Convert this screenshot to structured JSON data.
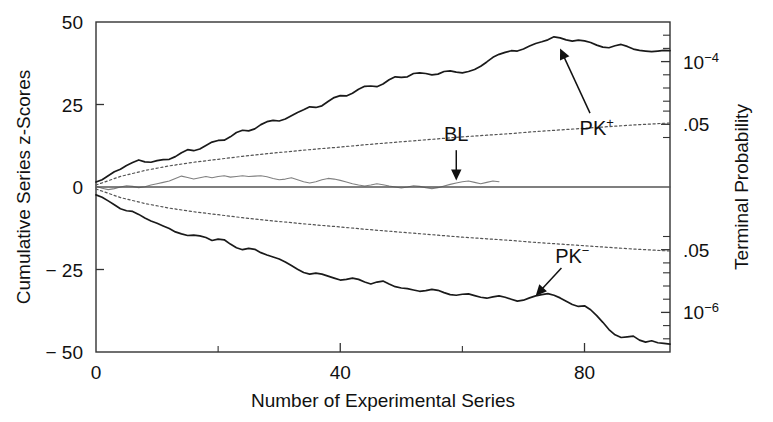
{
  "chart_data": {
    "type": "line",
    "title": "",
    "xlabel": "Number of Experimental Series",
    "ylabel": "Cumulative Series z-Scores",
    "y2label": "Terminal Probability",
    "xlim": [
      0,
      94
    ],
    "ylim": [
      -50,
      50
    ],
    "grid": false,
    "legend_position": "inline-annotations",
    "xticks": [
      0,
      40,
      80
    ],
    "xticklabels": [
      "0",
      "40",
      "80"
    ],
    "xminorticks": [
      20,
      60
    ],
    "yticks": [
      50,
      25,
      0,
      -25,
      -50
    ],
    "yticklabels": [
      "50",
      "25",
      "0",
      "− 25",
      "− 50"
    ],
    "y2ticks": [
      38,
      19,
      -19,
      -38
    ],
    "y2ticklabels": [
      "10⁻⁴",
      ".05",
      ".05",
      "10⁻⁶"
    ],
    "y2minorticks": [
      46,
      42,
      34,
      30,
      26,
      23,
      15,
      -15,
      -23,
      -26,
      -30,
      -34,
      -42,
      -46
    ],
    "annotations": [
      {
        "text": "PK⁺",
        "x": 82,
        "y": 18,
        "arrow_to_x": 76,
        "arrow_to_y": 42
      },
      {
        "text": "PK⁻",
        "x": 78,
        "y": -21,
        "arrow_to_x": 72,
        "arrow_to_y": -33
      },
      {
        "text": "BL",
        "x": 59,
        "y": 16,
        "arrow_to_x": 59,
        "arrow_to_y": 2
      }
    ],
    "series": [
      {
        "name": "PK+",
        "style": "solid",
        "color": "#1a1a1a",
        "width": 1.7,
        "x": [
          0,
          1,
          2,
          3,
          4,
          5,
          6,
          7,
          8,
          9,
          10,
          11,
          12,
          13,
          14,
          15,
          16,
          17,
          18,
          19,
          20,
          21,
          22,
          23,
          24,
          25,
          26,
          27,
          28,
          29,
          30,
          31,
          32,
          33,
          34,
          35,
          36,
          37,
          38,
          39,
          40,
          41,
          42,
          43,
          44,
          45,
          46,
          47,
          48,
          49,
          50,
          51,
          52,
          53,
          54,
          55,
          56,
          57,
          58,
          59,
          60,
          61,
          62,
          63,
          64,
          65,
          66,
          67,
          68,
          69,
          70,
          71,
          72,
          73,
          74,
          75,
          76,
          77,
          78,
          79,
          80,
          81,
          82,
          83,
          84,
          85,
          86,
          87,
          88,
          89,
          90,
          91,
          92,
          93,
          94
        ],
        "y": [
          1.5,
          2.2,
          3.4,
          4.6,
          5.4,
          6.5,
          7.4,
          8.2,
          7.6,
          7.5,
          8.0,
          8.3,
          8.4,
          9.2,
          10.4,
          11.3,
          11.0,
          11.5,
          12.6,
          13.6,
          14.1,
          14.2,
          15.2,
          16.5,
          17.2,
          17.0,
          17.6,
          18.9,
          19.8,
          20.2,
          20.0,
          20.6,
          21.6,
          22.6,
          23.4,
          24.3,
          24.1,
          24.6,
          25.9,
          27.1,
          27.7,
          27.6,
          28.4,
          29.6,
          30.5,
          30.6,
          30.4,
          31.2,
          32.5,
          33.4,
          33.2,
          33.4,
          34.4,
          34.6,
          34.4,
          34.0,
          34.2,
          35.0,
          35.2,
          34.8,
          34.6,
          35.0,
          35.6,
          36.6,
          37.9,
          39.3,
          40.2,
          40.8,
          41.3,
          41.2,
          41.8,
          42.7,
          43.5,
          44.0,
          44.6,
          45.5,
          45.2,
          44.6,
          44.2,
          44.5,
          44.3,
          43.8,
          43.0,
          42.4,
          42.2,
          42.8,
          43.2,
          42.6,
          41.8,
          41.4,
          41.2,
          41.0,
          41.2,
          41.4,
          41.3
        ]
      },
      {
        "name": "PK-",
        "style": "solid",
        "color": "#1a1a1a",
        "width": 1.7,
        "x": [
          0,
          1,
          2,
          3,
          4,
          5,
          6,
          7,
          8,
          9,
          10,
          11,
          12,
          13,
          14,
          15,
          16,
          17,
          18,
          19,
          20,
          21,
          22,
          23,
          24,
          25,
          26,
          27,
          28,
          29,
          30,
          31,
          32,
          33,
          34,
          35,
          36,
          37,
          38,
          39,
          40,
          41,
          42,
          43,
          44,
          45,
          46,
          47,
          48,
          49,
          50,
          51,
          52,
          53,
          54,
          55,
          56,
          57,
          58,
          59,
          60,
          61,
          62,
          63,
          64,
          65,
          66,
          67,
          68,
          69,
          70,
          71,
          72,
          73,
          74,
          75,
          76,
          77,
          78,
          79,
          80,
          81,
          82,
          83,
          84,
          85,
          86,
          87,
          88,
          89,
          90,
          91,
          92,
          93,
          94
        ],
        "y": [
          -2.4,
          -3.1,
          -4.2,
          -5.4,
          -6.6,
          -7.2,
          -7.4,
          -8.3,
          -9.4,
          -10.3,
          -11.0,
          -11.8,
          -12.6,
          -13.6,
          -14.2,
          -14.7,
          -14.6,
          -14.8,
          -15.3,
          -16.2,
          -15.8,
          -16.0,
          -17.3,
          -18.4,
          -19.0,
          -18.6,
          -18.9,
          -19.9,
          -20.6,
          -21.2,
          -21.8,
          -22.7,
          -23.8,
          -24.9,
          -25.9,
          -26.4,
          -26.1,
          -26.4,
          -27.0,
          -27.6,
          -28.2,
          -28.0,
          -27.6,
          -28.0,
          -28.8,
          -29.4,
          -28.8,
          -28.5,
          -29.4,
          -30.2,
          -30.6,
          -30.8,
          -31.2,
          -31.6,
          -31.4,
          -31.0,
          -31.3,
          -32.0,
          -32.6,
          -32.8,
          -32.5,
          -32.4,
          -32.9,
          -33.4,
          -33.7,
          -33.3,
          -33.0,
          -33.4,
          -34.0,
          -34.6,
          -34.3,
          -33.6,
          -33.0,
          -32.6,
          -32.3,
          -32.8,
          -33.6,
          -34.6,
          -35.6,
          -36.2,
          -36.0,
          -37.2,
          -39.0,
          -41.0,
          -43.2,
          -44.8,
          -45.6,
          -45.4,
          -45.2,
          -46.4,
          -47.0,
          -46.6,
          -47.2,
          -47.4,
          -47.6
        ]
      },
      {
        "name": "BL",
        "style": "solid",
        "color": "#808080",
        "width": 1.1,
        "x": [
          0,
          1,
          2,
          3,
          4,
          5,
          6,
          7,
          8,
          9,
          10,
          11,
          12,
          13,
          14,
          15,
          16,
          17,
          18,
          19,
          20,
          21,
          22,
          23,
          24,
          25,
          26,
          27,
          28,
          29,
          30,
          31,
          32,
          33,
          34,
          35,
          36,
          37,
          38,
          39,
          40,
          41,
          42,
          43,
          44,
          45,
          46,
          47,
          48,
          49,
          50,
          51,
          52,
          53,
          54,
          55,
          56,
          57,
          58,
          59,
          60,
          61,
          62,
          63,
          64,
          65,
          66
        ],
        "y": [
          0.2,
          -0.4,
          -0.8,
          -0.5,
          0.0,
          0.4,
          0.2,
          -0.2,
          0.1,
          0.6,
          1.0,
          1.4,
          1.8,
          2.6,
          3.3,
          2.9,
          2.4,
          2.8,
          3.2,
          2.8,
          3.2,
          3.4,
          3.0,
          3.2,
          3.4,
          3.2,
          3.3,
          3.4,
          3.1,
          2.6,
          2.2,
          2.4,
          2.8,
          2.2,
          1.6,
          1.2,
          1.6,
          2.2,
          2.6,
          2.4,
          2.0,
          1.5,
          1.0,
          0.6,
          0.3,
          0.6,
          1.0,
          0.7,
          0.3,
          0.0,
          -0.3,
          0.0,
          0.4,
          0.2,
          -0.2,
          -0.5,
          -0.2,
          0.3,
          0.8,
          1.2,
          1.6,
          1.8,
          1.4,
          1.0,
          1.4,
          1.8,
          1.6
        ]
      },
      {
        "name": "p=.05 upper envelope",
        "style": "dotted",
        "color": "#555555",
        "width": 1.2,
        "x": [
          0,
          4,
          8,
          12,
          16,
          20,
          24,
          28,
          32,
          36,
          40,
          44,
          48,
          52,
          56,
          60,
          64,
          68,
          72,
          76,
          80,
          84,
          88,
          91,
          94
        ],
        "y": [
          0.6,
          3.2,
          5.0,
          6.4,
          7.5,
          8.4,
          9.3,
          10.1,
          10.8,
          11.5,
          12.1,
          12.8,
          13.4,
          14.0,
          14.6,
          15.2,
          15.7,
          16.2,
          16.8,
          17.3,
          17.8,
          18.3,
          18.8,
          19.1,
          19.4
        ]
      },
      {
        "name": "p=.05 lower envelope",
        "style": "dotted",
        "color": "#555555",
        "width": 1.2,
        "x": [
          0,
          4,
          8,
          12,
          16,
          20,
          24,
          28,
          32,
          36,
          40,
          44,
          48,
          52,
          56,
          60,
          64,
          68,
          72,
          76,
          80,
          84,
          88,
          91,
          94
        ],
        "y": [
          -0.6,
          -3.2,
          -5.0,
          -6.4,
          -7.5,
          -8.4,
          -9.3,
          -10.1,
          -10.8,
          -11.5,
          -12.1,
          -12.8,
          -13.4,
          -14.0,
          -14.6,
          -15.2,
          -15.7,
          -16.2,
          -16.8,
          -17.3,
          -17.8,
          -18.3,
          -18.8,
          -19.1,
          -19.4
        ]
      },
      {
        "name": "zero reference line",
        "style": "solid",
        "color": "#555555",
        "width": 1.4,
        "x": [
          0,
          94
        ],
        "y": [
          0,
          0
        ]
      }
    ]
  },
  "axes": {
    "y_left_title": "Cumulative Series z-Scores",
    "y_right_title": "Terminal Probability",
    "x_title": "Number of Experimental Series"
  }
}
